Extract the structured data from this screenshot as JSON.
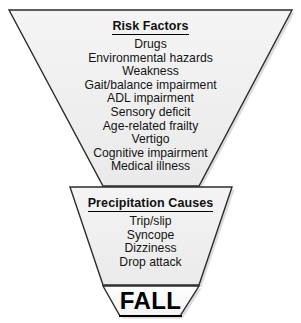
{
  "diagram": {
    "background_color": "#ffffff",
    "shape_fill_color": "#efefef",
    "shape_stroke_color": "#2b2b2b",
    "text_color": "#141414"
  },
  "risk_factors": {
    "heading": "Risk Factors",
    "items": [
      "Drugs",
      "Environmental hazards",
      "Weakness",
      "Gait/balance impairment",
      "ADL impairment",
      "Sensory deficit",
      "Age-related frailty",
      "Vertigo",
      "Cognitive impairment",
      "Medical illness"
    ]
  },
  "precipitating_causes": {
    "heading": "Precipitation Causes",
    "items": [
      "Trip/slip",
      "Syncope",
      "Dizziness",
      "Drop attack"
    ]
  },
  "outcome": {
    "label": "FALL"
  }
}
